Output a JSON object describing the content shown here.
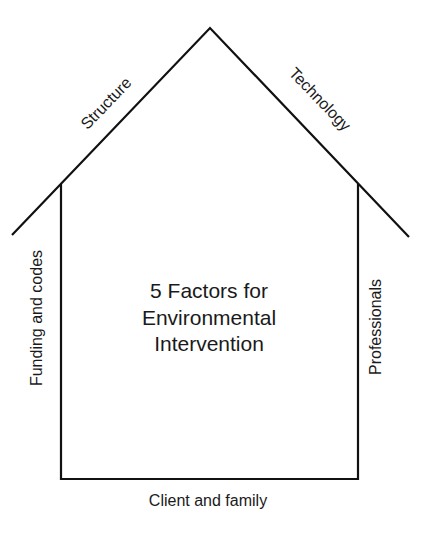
{
  "diagram": {
    "title_lines": [
      "5 Factors for",
      "Environmental",
      "Intervention"
    ],
    "labels": {
      "roof_left": "Structure",
      "roof_right": "Technology",
      "wall_left": "Funding and codes",
      "wall_right": "Professionals",
      "floor": "Client and family"
    },
    "shape": "house",
    "line_color": "#111111"
  }
}
